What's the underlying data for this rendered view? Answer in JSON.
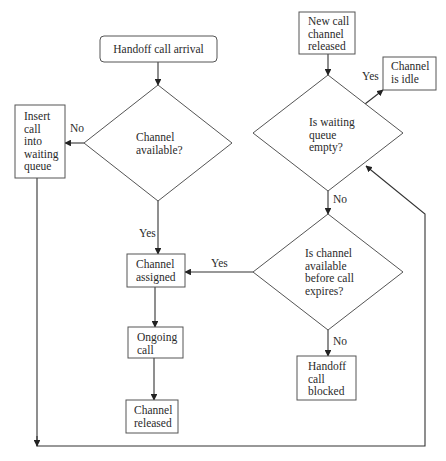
{
  "diagram": {
    "type": "flowchart",
    "nodes": [
      {
        "id": "handoff_arrival",
        "kind": "terminal",
        "lines": [
          "Handoff call arrival"
        ]
      },
      {
        "id": "channel_available",
        "kind": "decision",
        "lines": [
          "Channel",
          "available?"
        ]
      },
      {
        "id": "insert_queue",
        "kind": "process",
        "lines": [
          "Insert",
          "call",
          "into",
          "waiting",
          "queue"
        ]
      },
      {
        "id": "channel_assigned",
        "kind": "process",
        "lines": [
          "Channel",
          "assigned"
        ]
      },
      {
        "id": "ongoing_call",
        "kind": "process",
        "lines": [
          "Ongoing",
          "call"
        ]
      },
      {
        "id": "channel_released",
        "kind": "process",
        "lines": [
          "Channel",
          "released"
        ]
      },
      {
        "id": "new_call_released",
        "kind": "process",
        "lines": [
          "New call",
          "channel",
          "released"
        ]
      },
      {
        "id": "queue_empty",
        "kind": "decision",
        "lines": [
          "Is waiting",
          "queue",
          "empty?"
        ]
      },
      {
        "id": "channel_idle",
        "kind": "process",
        "lines": [
          "Channel",
          "is idle"
        ]
      },
      {
        "id": "before_expiry",
        "kind": "decision",
        "lines": [
          "Is channel",
          "available",
          "before call",
          "expires?"
        ]
      },
      {
        "id": "handoff_blocked",
        "kind": "process",
        "lines": [
          "Handoff",
          "call",
          "blocked"
        ]
      }
    ],
    "edges": [
      {
        "from": "handoff_arrival",
        "to": "channel_available",
        "label": ""
      },
      {
        "from": "channel_available",
        "to": "insert_queue",
        "label": "No"
      },
      {
        "from": "channel_available",
        "to": "channel_assigned",
        "label": "Yes"
      },
      {
        "from": "channel_assigned",
        "to": "ongoing_call",
        "label": ""
      },
      {
        "from": "ongoing_call",
        "to": "channel_released",
        "label": ""
      },
      {
        "from": "new_call_released",
        "to": "queue_empty",
        "label": ""
      },
      {
        "from": "queue_empty",
        "to": "channel_idle",
        "label": "Yes"
      },
      {
        "from": "queue_empty",
        "to": "before_expiry",
        "label": "No"
      },
      {
        "from": "before_expiry",
        "to": "channel_assigned",
        "label": "Yes"
      },
      {
        "from": "before_expiry",
        "to": "handoff_blocked",
        "label": "No"
      },
      {
        "from": "insert_queue",
        "to": "queue_empty",
        "label": ""
      }
    ]
  }
}
